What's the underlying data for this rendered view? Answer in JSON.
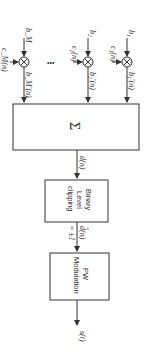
{
  "diagram": {
    "orientation": "rotated-90-clockwise",
    "inputs": [
      {
        "bit": "b₁",
        "code": "c₁(n)",
        "product": "b₁'(n)"
      },
      {
        "bit": "b₂",
        "code": "c₂(n)",
        "product": "b₂'(n)"
      },
      {
        "bit": "b_M",
        "code": "c_M(n)",
        "product": "b_M'(n)"
      }
    ],
    "ellipsis": "•••",
    "summer": {
      "symbol": "Σ"
    },
    "sum_output": "d(n)",
    "clipper": {
      "line1": "Binary",
      "line2": "Level",
      "line3": "clipping"
    },
    "clipper_output": "d̂(n)",
    "clipper_output_value": "= ±1",
    "modulator": {
      "line1": "PW",
      "line2": "Modulation"
    },
    "final_output": "s(t)"
  },
  "colors": {
    "line": "#333333",
    "background": "#ffffff"
  }
}
